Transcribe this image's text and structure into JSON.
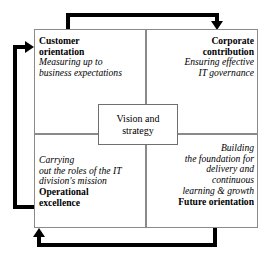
{
  "diagram": {
    "center": {
      "line1": "Vision and",
      "line2": "strategy"
    },
    "quadrants": {
      "top_left": {
        "title_line1": "Customer",
        "title_line2": "orientation",
        "sub_line1": "Measuring up to",
        "sub_line2": "business expectations"
      },
      "top_right": {
        "title_line1": "Corporate",
        "title_line2": "contribution",
        "sub_line1": "Ensuring effective",
        "sub_line2": "IT governance"
      },
      "bottom_left": {
        "sub_line1": "Carrying",
        "sub_line2": "out the roles of the IT",
        "sub_line3": "division's mission",
        "title_line1": "Operational",
        "title_line2": "excellence"
      },
      "bottom_right": {
        "sub_line1": "Building",
        "sub_line2": "the foundation for",
        "sub_line3": "delivery and",
        "sub_line4": "continuous",
        "sub_line5": "learning & growth",
        "title_line1": "Future orientation"
      }
    },
    "arrows": {
      "top": "top-flow-arrow",
      "left": "left-flow-arrow",
      "bottom": "bottom-flow-arrow"
    },
    "colors": {
      "frame_border": "#8a8a8a",
      "arrow": "#000000",
      "background": "#ffffff",
      "text": "#000000"
    }
  }
}
